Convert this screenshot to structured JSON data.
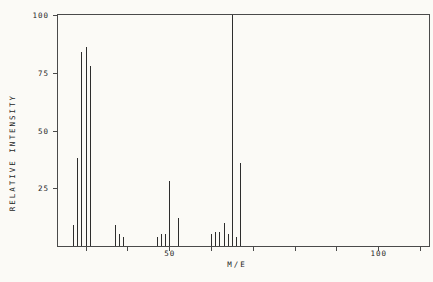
{
  "chart": {
    "y_axis_title": "RELATIVE INTENSITY",
    "x_axis_title": "M/E"
  },
  "chart_data": {
    "type": "bar",
    "chart_kind": "mass-spectrum",
    "title": "",
    "xlabel": "M/E",
    "ylabel": "RELATIVE INTENSITY",
    "xlim": [
      23.3,
      112
    ],
    "ylim": [
      0,
      100
    ],
    "grid": false,
    "legend": false,
    "x_major_ticks": [
      {
        "value": 50,
        "label": "50"
      },
      {
        "value": 100,
        "label": "100"
      }
    ],
    "x_minor_tick_values": [
      30,
      40,
      50,
      60,
      70,
      80,
      90,
      100,
      110
    ],
    "y_major_ticks": [
      {
        "value": 100,
        "label": "100"
      },
      {
        "value": 75,
        "label": "75"
      },
      {
        "value": 50,
        "label": "50"
      },
      {
        "value": 25,
        "label": "25"
      }
    ],
    "peaks": [
      {
        "mz": 27,
        "intensity": 9
      },
      {
        "mz": 28,
        "intensity": 38
      },
      {
        "mz": 29,
        "intensity": 84
      },
      {
        "mz": 30,
        "intensity": 86
      },
      {
        "mz": 31,
        "intensity": 78
      },
      {
        "mz": 37,
        "intensity": 9
      },
      {
        "mz": 38,
        "intensity": 5
      },
      {
        "mz": 39,
        "intensity": 4
      },
      {
        "mz": 47,
        "intensity": 4
      },
      {
        "mz": 48,
        "intensity": 5
      },
      {
        "mz": 49,
        "intensity": 5
      },
      {
        "mz": 50,
        "intensity": 28
      },
      {
        "mz": 52,
        "intensity": 12
      },
      {
        "mz": 60,
        "intensity": 5
      },
      {
        "mz": 61,
        "intensity": 6
      },
      {
        "mz": 62,
        "intensity": 6
      },
      {
        "mz": 63,
        "intensity": 10
      },
      {
        "mz": 64,
        "intensity": 5
      },
      {
        "mz": 65,
        "intensity": 100
      },
      {
        "mz": 66,
        "intensity": 4
      },
      {
        "mz": 67,
        "intensity": 36
      }
    ],
    "colors": {
      "background": "#fbfaf6",
      "frame": "#4a4a4a",
      "peak": "#2d2d2d",
      "text": "#1e1e1e"
    }
  }
}
